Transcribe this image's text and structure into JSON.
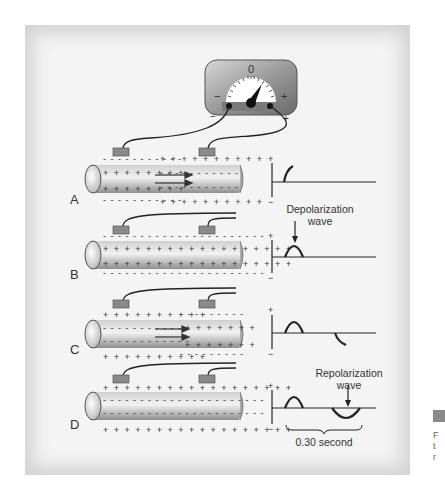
{
  "figure": {
    "meter": {
      "zero_label": "0",
      "minus_label": "−",
      "plus_label": "+",
      "terminal_minus_label": "−",
      "terminal_plus_label": "+"
    },
    "panels": [
      {
        "id": "A",
        "label": "A",
        "state": "partially depolarized",
        "arrows": true
      },
      {
        "id": "B",
        "label": "B",
        "state": "fully depolarized",
        "arrows": false
      },
      {
        "id": "C",
        "label": "C",
        "state": "partially repolarized",
        "arrows": true
      },
      {
        "id": "D",
        "label": "D",
        "state": "fully repolarized",
        "arrows": false
      }
    ],
    "traces": [
      {
        "panel": "A",
        "plus": "+",
        "minus": "−"
      },
      {
        "panel": "B",
        "plus": "+",
        "minus": "−",
        "annotation_line1": "Depolarization",
        "annotation_line2": "wave"
      },
      {
        "panel": "C",
        "plus": "+",
        "minus": "−"
      },
      {
        "panel": "D",
        "plus": "+",
        "minus": "−",
        "annotation_line1": "Repolarization",
        "annotation_line2": "wave",
        "duration_label": "0.30 second"
      }
    ],
    "colors": {
      "frame_bg": "#f4f4f4",
      "fiber_light": "#e8e8e8",
      "fiber_dark": "#9a9a9a",
      "electrode": "#8a8a8a",
      "ink": "#222222"
    }
  }
}
